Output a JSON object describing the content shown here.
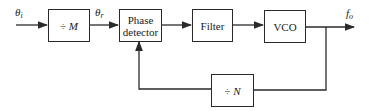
{
  "diagram": {
    "type": "block-diagram",
    "input_label": {
      "symbol": "θ",
      "subscript": "i"
    },
    "reference_label": {
      "symbol": "θ",
      "subscript": "r"
    },
    "output_label": {
      "symbol": "f",
      "subscript": "o"
    },
    "blocks": [
      {
        "id": "divide_m",
        "op": "÷",
        "var": "M"
      },
      {
        "id": "phase_detector",
        "line1": "Phase",
        "line2": "detector"
      },
      {
        "id": "filter",
        "label": "Filter"
      },
      {
        "id": "vco",
        "label": "VCO"
      },
      {
        "id": "divide_n",
        "op": "÷",
        "var": "N"
      }
    ],
    "connections": [
      "input -> divide_m",
      "divide_m -> phase_detector",
      "phase_detector -> filter",
      "filter -> vco",
      "vco -> output",
      "vco -> divide_n",
      "divide_n -> phase_detector"
    ],
    "line_color": "#2a2a2a"
  }
}
